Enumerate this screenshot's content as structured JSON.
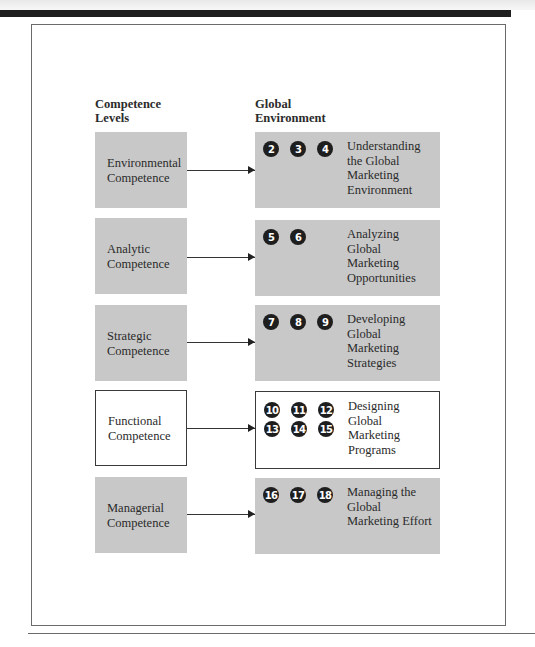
{
  "columns": {
    "left_header": "Competence Levels",
    "left_header_lines": [
      "Competence",
      "Levels"
    ],
    "right_header": "Global Environment",
    "right_header_lines": [
      "Global",
      "Environment"
    ]
  },
  "rows": [
    {
      "competence_lines": [
        "Environmental",
        "Competence"
      ],
      "chapters": [
        "2",
        "3",
        "4"
      ],
      "topic_lines": [
        "Understanding",
        "the Global",
        "Marketing",
        "Environment"
      ],
      "highlighted": false
    },
    {
      "competence_lines": [
        "Analytic",
        "Competence"
      ],
      "chapters": [
        "5",
        "6"
      ],
      "topic_lines": [
        "Analyzing",
        "Global",
        "Marketing",
        "Opportunities"
      ],
      "highlighted": false
    },
    {
      "competence_lines": [
        "Strategic",
        "Competence"
      ],
      "chapters": [
        "7",
        "8",
        "9"
      ],
      "topic_lines": [
        "Developing",
        "Global",
        "Marketing",
        "Strategies"
      ],
      "highlighted": false
    },
    {
      "competence_lines": [
        "Functional",
        "Competence"
      ],
      "chapters": [
        "10",
        "11",
        "12",
        "13",
        "14",
        "15"
      ],
      "topic_lines": [
        "Designing",
        "Global",
        "Marketing",
        "Programs"
      ],
      "highlighted": true
    },
    {
      "competence_lines": [
        "Managerial",
        "Competence"
      ],
      "chapters": [
        "16",
        "17",
        "18"
      ],
      "topic_lines": [
        "Managing the",
        "Global",
        "Marketing Effort"
      ],
      "highlighted": false
    }
  ],
  "colors": {
    "box_fill": "#c8c8c8",
    "highlight_fill": "#ffffff",
    "badge_fill": "#1e1e1e",
    "badge_text": "#ffffff"
  }
}
